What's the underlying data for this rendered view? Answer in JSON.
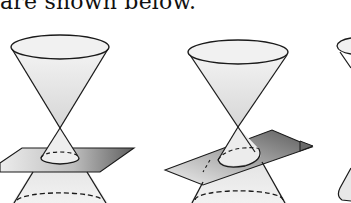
{
  "document": {
    "caption_text": "are shown below.",
    "figures": [
      {
        "id": "figure-1",
        "description": "double cone intersected by horizontal plane (circle)"
      },
      {
        "id": "figure-2",
        "description": "double cone intersected by tilted plane (ellipse)"
      },
      {
        "id": "figure-3",
        "description": "partially visible double cone (cropped at right edge)"
      }
    ]
  },
  "colors": {
    "line": "#1a1a1a",
    "cone_fill_light": "#f2f2f2",
    "cone_fill_mid": "#d9d9d9",
    "plane_light": "#e6e6e6",
    "plane_dark": "#6e6e6e",
    "background": "#ffffff"
  }
}
